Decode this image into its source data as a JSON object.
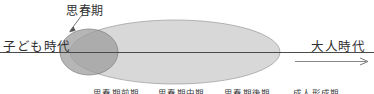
{
  "diagram": {
    "axis": {
      "left_label": "子ども時代",
      "right_label": "大人時代",
      "arrow_name": "rightward-arrow"
    },
    "callout": {
      "label": "思春期"
    },
    "regions": [
      {
        "name": "puberty-ellipse",
        "fill": "#a8a8a8"
      },
      {
        "name": "adolescence-ellipse",
        "fill": "#d4d4d4"
      }
    ],
    "stages": [
      {
        "label": "思春期前期"
      },
      {
        "label": "思春期中期"
      },
      {
        "label": "思春期後期"
      },
      {
        "label": "成人形成期"
      }
    ],
    "colors": {
      "axis_line": "#4a4a4a",
      "ellipse_stroke": "#8f8f8f",
      "text": "#303030",
      "background": "#ffffff"
    }
  }
}
